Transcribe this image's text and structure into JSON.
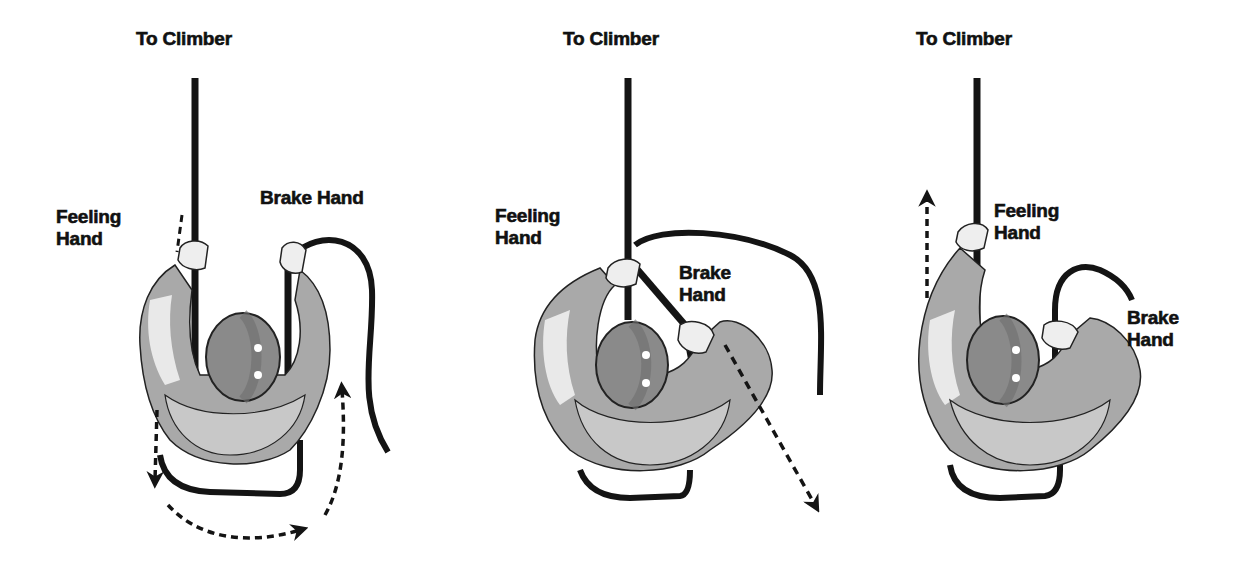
{
  "figure": {
    "colors": {
      "rope": "#141414",
      "jacket_shadow": "#a8a8a8",
      "jacket_light": "#f2f2f2",
      "helmet_dark": "#7a7a7a",
      "helmet_mid": "#9a9a9a",
      "outline": "#222222",
      "background": "#ffffff"
    },
    "panels": [
      {
        "step": 1,
        "top_label": "To Climber",
        "feeling_label": "Feeling\nHand",
        "brake_label": "Brake Hand",
        "arrows": [
          "dashed arrow down along feeling side",
          "dashed arc arrow around belayer bottom",
          "dashed arrow up along brake side"
        ]
      },
      {
        "step": 2,
        "top_label": "To Climber",
        "feeling_label": "Feeling\nHand",
        "brake_label": "Brake\nHand",
        "arrows": [
          "dashed arrow diagonally down-right from brake hand"
        ]
      },
      {
        "step": 3,
        "top_label": "To Climber",
        "feeling_label": "Feeling\nHand",
        "brake_label": "Brake\nHand",
        "arrows": [
          "dashed arrow up along feeling hand"
        ]
      }
    ]
  }
}
